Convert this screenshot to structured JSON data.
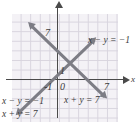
{
  "figure": {
    "type": "line-graph"
  },
  "axes": {
    "x_axis_name": "x",
    "tick_labels": {
      "origin": "0",
      "x_neg_one": "-1",
      "y_one": "1",
      "x_seven": "7",
      "y_seven": "7"
    }
  },
  "labels": {
    "right_equation": "x − y = −1",
    "middle_bottom_equation": "x + y = 7",
    "bottom_left_equation_1": "x − y = −1",
    "bottom_left_equation_2": "x + y = 7"
  },
  "colors": {
    "grid_fill": "#f4f2f6",
    "grid_line": "#d8d4de",
    "axis": "#4a4a4a",
    "plot_line": "#7d7d85",
    "text": "#3b3b3b"
  },
  "chart_data": {
    "type": "line",
    "title": "",
    "xlabel": "x",
    "ylabel": "",
    "grid": true,
    "legend": "inline-annotations",
    "xlim": [
      -5,
      8
    ],
    "ylim": [
      -4,
      9
    ],
    "series": [
      {
        "name": "x − y = −1",
        "slope": 1,
        "intercept": 1,
        "points": [
          [
            -4,
            -3
          ],
          [
            0,
            1
          ],
          [
            3,
            4
          ],
          [
            7,
            8
          ]
        ]
      },
      {
        "name": "x + y = 7",
        "slope": -1,
        "intercept": 7,
        "points": [
          [
            -1,
            8
          ],
          [
            0,
            7
          ],
          [
            3,
            4
          ],
          [
            7,
            0
          ]
        ]
      }
    ],
    "intersection": [
      3,
      4
    ],
    "annotations": [
      {
        "text": "x − y = −1",
        "x": 5.6,
        "y": 5.2
      },
      {
        "text": "x + y = 7",
        "x": 1.5,
        "y": -2.3
      },
      {
        "text": "x − y = −1",
        "x": -5.2,
        "y": -2.4
      },
      {
        "text": "x + y = 7",
        "x": -5.2,
        "y": -3.7
      }
    ]
  }
}
